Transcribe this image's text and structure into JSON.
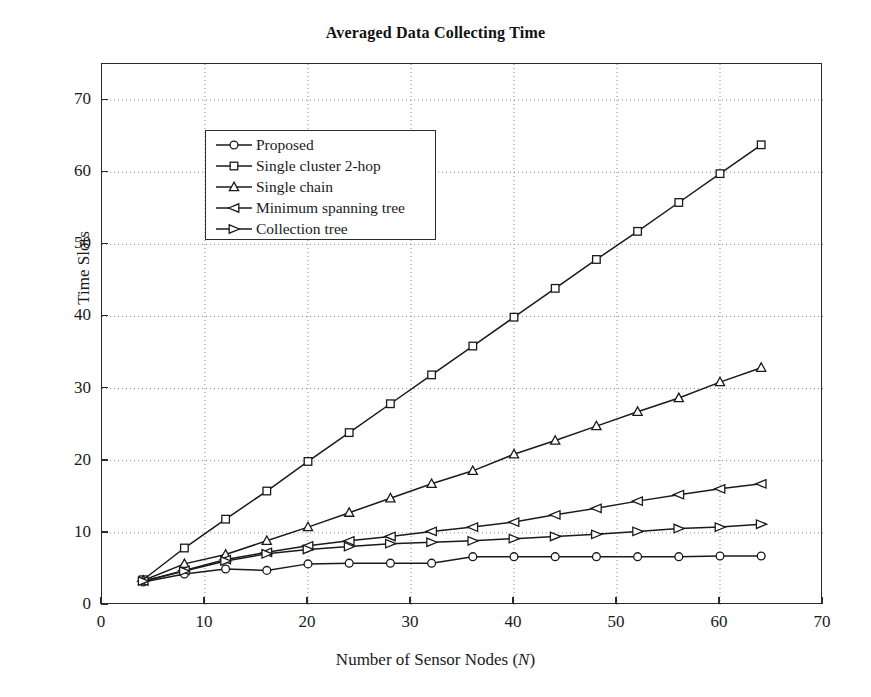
{
  "chart_data": {
    "type": "line",
    "title": "Averaged Data Collecting Time",
    "xlabel": "Number of Sensor Nodes (N)",
    "xlabel_plain": "Number of Sensor Nodes (",
    "xlabel_italic": "N",
    "xlabel_tail": ")",
    "ylabel": "Time Slots",
    "xlim": [
      0,
      70
    ],
    "ylim": [
      0,
      75
    ],
    "xticks": [
      0,
      10,
      20,
      30,
      40,
      50,
      60,
      70
    ],
    "yticks": [
      0,
      10,
      20,
      30,
      40,
      50,
      60,
      70
    ],
    "grid": true,
    "grid_style": "dotted",
    "legend_position": "top-left",
    "x": [
      4,
      8,
      12,
      16,
      20,
      24,
      28,
      32,
      36,
      40,
      44,
      48,
      52,
      56,
      60,
      64
    ],
    "series": [
      {
        "name": "Proposed",
        "marker": "circle",
        "values": [
          3.2,
          4.3,
          5.0,
          4.8,
          5.7,
          5.8,
          5.8,
          5.8,
          6.7,
          6.7,
          6.7,
          6.7,
          6.7,
          6.7,
          6.8,
          6.8
        ]
      },
      {
        "name": "Single cluster 2-hop",
        "marker": "square",
        "values": [
          3.5,
          7.9,
          11.9,
          15.8,
          19.9,
          23.9,
          27.9,
          31.9,
          35.9,
          39.9,
          43.9,
          47.9,
          51.8,
          55.8,
          59.8,
          63.8
        ]
      },
      {
        "name": "Single chain",
        "marker": "triangle-up",
        "values": [
          3.4,
          5.7,
          7.0,
          8.9,
          10.8,
          12.8,
          14.8,
          16.8,
          18.6,
          20.9,
          22.8,
          24.8,
          26.8,
          28.7,
          30.9,
          32.9
        ]
      },
      {
        "name": "Minimum spanning tree",
        "marker": "triangle-left",
        "values": [
          3.3,
          4.8,
          6.3,
          7.3,
          8.2,
          8.9,
          9.5,
          10.2,
          10.8,
          11.5,
          12.5,
          13.4,
          14.4,
          15.3,
          16.1,
          16.8
        ]
      },
      {
        "name": "Collection tree",
        "marker": "triangle-right",
        "values": [
          3.3,
          4.7,
          6.1,
          7.1,
          7.7,
          8.1,
          8.5,
          8.7,
          8.9,
          9.2,
          9.5,
          9.8,
          10.2,
          10.6,
          10.8,
          11.2
        ]
      }
    ]
  },
  "axis": {
    "line_color": "#2a2a2a",
    "grid_color": "#8a8a8a",
    "series_color": "#1a1a1a"
  }
}
